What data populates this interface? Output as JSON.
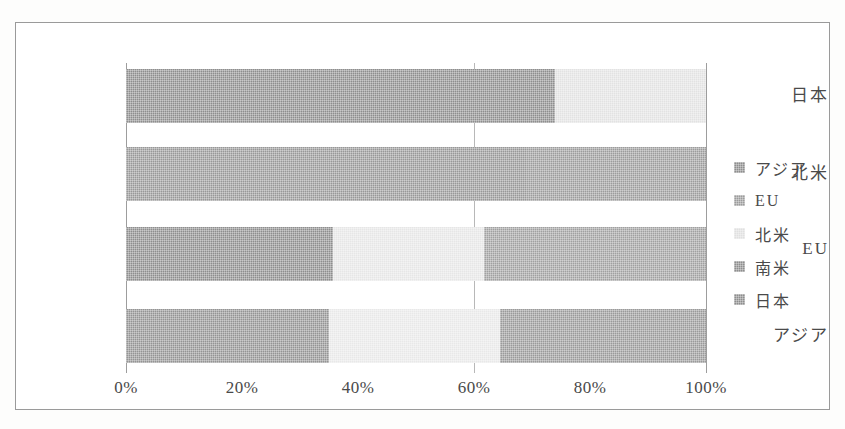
{
  "chart_data": {
    "type": "bar",
    "orientation": "horizontal",
    "stacked": true,
    "normalized": "100%",
    "title": "",
    "subtitle": "",
    "xlabel": "",
    "ylabel": "",
    "xlim": [
      0,
      100
    ],
    "xticks": [
      0,
      20,
      40,
      60,
      80,
      100
    ],
    "xticklabels": [
      "0%",
      "20%",
      "40%",
      "60%",
      "80%",
      "100%"
    ],
    "grid": true,
    "legend_position": "right",
    "categories": [
      "日本",
      "北米",
      "EU",
      "アジア"
    ],
    "series": [
      {
        "name": "アジア",
        "color": "#8e8e8e",
        "values": [
          74.0,
          69.0,
          35.7,
          35.0
        ]
      },
      {
        "name": "EU",
        "color": "#9c9c9c",
        "values": [
          0.0,
          31.0,
          0.0,
          0.0
        ]
      },
      {
        "name": "北米",
        "color": "#e2e2e2",
        "values": [
          26.0,
          0.0,
          26.0,
          29.5
        ]
      },
      {
        "name": "南米",
        "color": "#8e8e8e",
        "values": [
          0.0,
          0.0,
          38.3,
          35.5
        ]
      },
      {
        "name": "日本",
        "color": "#9c9c9c",
        "values": [
          0.0,
          0.0,
          0.0,
          0.0
        ]
      }
    ],
    "bars": [
      {
        "category": "日本",
        "segments": [
          {
            "label": "アジア",
            "value": 74.0,
            "color": "#8e8e8e"
          },
          {
            "label": "北米",
            "value": 26.0,
            "color": "#e2e2e2"
          }
        ]
      },
      {
        "category": "北米",
        "segments": [
          {
            "label": "アジア",
            "value": 69.0,
            "color": "#989898"
          },
          {
            "label": "EU",
            "value": 31.0,
            "color": "#9c9c9c"
          }
        ]
      },
      {
        "category": "EU",
        "segments": [
          {
            "label": "アジア",
            "value": 35.7,
            "color": "#8e8e8e"
          },
          {
            "label": "北米",
            "value": 26.0,
            "color": "#e6e6e6"
          },
          {
            "label": "南米",
            "value": 38.3,
            "color": "#a0a0a0"
          }
        ]
      },
      {
        "category": "アジア",
        "segments": [
          {
            "label": "アジア",
            "value": 35.0,
            "color": "#949494"
          },
          {
            "label": "北米",
            "value": 29.5,
            "color": "#e8e8e8"
          },
          {
            "label": "南米",
            "value": 35.5,
            "color": "#9a9a9a"
          }
        ]
      }
    ]
  },
  "axis": {
    "yticklabels": [
      "日本",
      "北米",
      "EU",
      "アジア"
    ],
    "xticklabels": [
      "0%",
      "20%",
      "40%",
      "60%",
      "80%",
      "100%"
    ]
  },
  "legend": {
    "items": [
      {
        "label": "アジア",
        "color": "#8e8e8e"
      },
      {
        "label": "EU",
        "color": "#9c9c9c"
      },
      {
        "label": "北米",
        "color": "#e0e0e0"
      },
      {
        "label": "南米",
        "color": "#8e8e8e"
      },
      {
        "label": "日本",
        "color": "#8e8e8e"
      }
    ]
  }
}
